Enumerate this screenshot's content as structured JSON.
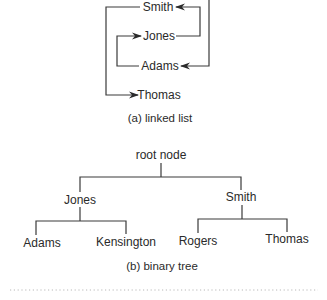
{
  "linked_list": {
    "nodes": [
      {
        "id": "smith",
        "label": "Smith"
      },
      {
        "id": "jones",
        "label": "Jones"
      },
      {
        "id": "adams",
        "label": "Adams"
      },
      {
        "id": "thomas",
        "label": "Thomas"
      }
    ],
    "links": [
      {
        "from": "head",
        "to": "adams"
      },
      {
        "from": "adams",
        "to": "jones"
      },
      {
        "from": "jones",
        "to": "smith"
      },
      {
        "from": "smith",
        "to": "thomas"
      }
    ],
    "caption": "(a) linked list"
  },
  "binary_tree": {
    "root": {
      "label": "root node"
    },
    "nodes": [
      {
        "id": "jones",
        "label": "Jones",
        "parent": "root"
      },
      {
        "id": "smith",
        "label": "Smith",
        "parent": "root"
      },
      {
        "id": "adams",
        "label": "Adams",
        "parent": "jones"
      },
      {
        "id": "kensington",
        "label": "Kensington",
        "parent": "jones"
      },
      {
        "id": "rogers",
        "label": "Rogers",
        "parent": "smith"
      },
      {
        "id": "thomas",
        "label": "Thomas",
        "parent": "smith"
      }
    ],
    "caption": "(b) binary tree"
  },
  "colors": {
    "line": "#3a3a3a",
    "text": "#2a2a2a",
    "divider": "#b8b8b8"
  }
}
